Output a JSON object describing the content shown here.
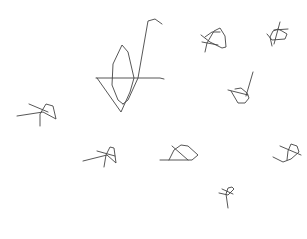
{
  "canvas": {
    "width": 307,
    "height": 239,
    "background": "#ffffff",
    "stroke_color": "#444444",
    "stroke_width": 0.9
  },
  "sketches": [
    {
      "name": "large-sailboat-sketch",
      "strokes": [
        "M96,78 L160,78 L164,79",
        "M97,78 L121,112 L130,92 L134,78 L128,52 L122,45 L113,64 L112,85 L118,100 L123,104",
        "M123,104 L128,100 L138,78 L148,21 L155,19 L162,24"
      ]
    },
    {
      "name": "sketch-top-center-right",
      "strokes": [
        "M201,35 L210,42 L222,48 L226,47 L225,36 L220,28 L214,31 L207,43 L205,52",
        "M205,37 L212,32 L220,32",
        "M202,42 L218,45"
      ]
    },
    {
      "name": "sketch-top-right",
      "strokes": [
        "M267,34 L272,40 L285,39 L287,34 L282,31 L278,29 L273,31 L270,37 L272,46",
        "M280,22 L274,44",
        "M274,30 L288,29"
      ]
    },
    {
      "name": "sketch-right-middle",
      "strokes": [
        "M228,90 L248,95",
        "M231,91 L238,103 L245,103 L249,98 L247,93 L241,88 L235,89",
        "M246,96 L253,72"
      ]
    },
    {
      "name": "sketch-left-middle",
      "strokes": [
        "M17,116 L43,112 L56,119 L53,106 L46,104 L40,114 L40,126",
        "M29,104 L48,112"
      ]
    },
    {
      "name": "sketch-bottom-left",
      "strokes": [
        "M83,161 L107,155 L116,163 L114,148 L110,147 L106,155 L104,167",
        "M97,151 L115,156"
      ]
    },
    {
      "name": "sketch-bottom-center",
      "strokes": [
        "M160,160 L192,160 L198,155 L188,146 L181,145 L174,150 L169,160",
        "M172,146 L188,160"
      ]
    },
    {
      "name": "sketch-bottom-right",
      "strokes": [
        "M273,157 L283,162 L291,159 L299,152 L297,146 L291,144 L288,151 L287,160",
        "M280,146 L301,155"
      ]
    },
    {
      "name": "sketch-bottom-small",
      "strokes": [
        "M219,193 L228,195 L234,189 L232,187 L228,188 L226,194 L228,208",
        "M222,189 L233,194"
      ]
    }
  ]
}
